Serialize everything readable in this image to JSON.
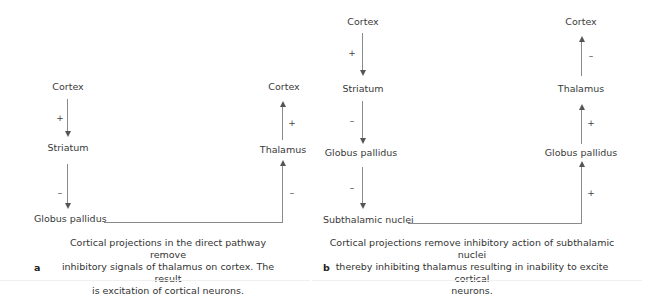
{
  "panel_a": {
    "letter": "a",
    "nodes": {
      "cortex_left": "Cortex",
      "striatum": "Striatum",
      "globus_pallidus": "Globus pallidus",
      "thalamus": "Thalamus",
      "cortex_right": "Cortex"
    },
    "signs": {
      "cortex_to_striatum": "+",
      "striatum_to_gp": "–",
      "gp_to_thalamus": "–",
      "thalamus_to_cortex": "+"
    },
    "caption": "Cortical projections in the direct pathway remove inhibitory signals of thalamus on cortex. The result is excitation of cortical neurons.",
    "caption_lines": [
      "Cortical projections in the direct pathway remove",
      "inhibitory signals of thalamus on cortex. The result",
      "is excitation of cortical neurons."
    ]
  },
  "panel_b": {
    "letter": "b",
    "nodes": {
      "cortex_left": "Cortex",
      "striatum": "Striatum",
      "globus_pallidus_left": "Globus pallidus",
      "subthalamic_nuclei": "Subthalamic nuclei",
      "globus_pallidus_right": "Globus pallidus",
      "thalamus": "Thalamus",
      "cortex_right": "Cortex"
    },
    "signs": {
      "cortex_to_striatum": "+",
      "striatum_to_gp": "–",
      "gp_to_stn": "–",
      "stn_to_gp": "+",
      "gp_to_thalamus": "+",
      "thalamus_to_cortex": "–"
    },
    "caption": "Cortical projections remove inhibitory action of subthalamic nuclei thereby inhibiting thalamus resulting in inability to excite cortical neurons.",
    "caption_lines": [
      "Cortical projections remove inhibitory action of subthalamic nuclei",
      "thereby inhibiting thalamus resulting in inability to excite cortical",
      "neurons."
    ]
  }
}
